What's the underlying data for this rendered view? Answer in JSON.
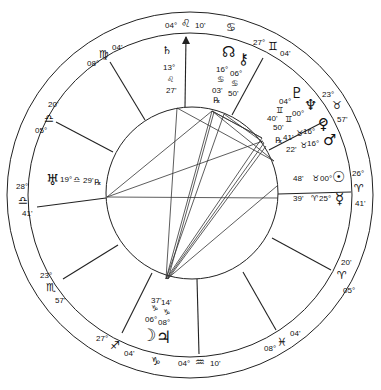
{
  "chart": {
    "type": "natal-astrology-wheel",
    "houses": [
      {
        "cusp": "asc",
        "deg": "28°",
        "sign": "♎",
        "min": "41'"
      },
      {
        "cusp": "2",
        "deg": "23°",
        "sign": "♏",
        "min": "57'"
      },
      {
        "cusp": "3",
        "deg": "27°",
        "sign": "♐",
        "min": "04'"
      },
      {
        "cusp": "ic",
        "deg": "04°",
        "sign": "♒",
        "min": "10'"
      },
      {
        "cusp": "5",
        "deg": "08°",
        "sign": "♓",
        "min": "04'"
      },
      {
        "cusp": "6",
        "deg": "05°",
        "sign": "♈",
        "min": "20'"
      },
      {
        "cusp": "dsc",
        "deg": "26°",
        "sign": "♈",
        "min": "41'"
      },
      {
        "cusp": "8",
        "deg": "23°",
        "sign": "♉",
        "min": "57'"
      },
      {
        "cusp": "9",
        "deg": "27°",
        "sign": "♊",
        "min": "04'"
      },
      {
        "cusp": "mc",
        "deg": "04°",
        "sign": "♌",
        "min": "10'"
      },
      {
        "cusp": "11",
        "deg": "08°",
        "sign": "♍",
        "min": "04'"
      },
      {
        "cusp": "12",
        "deg": "05°",
        "sign": "♎",
        "min": "20'"
      }
    ],
    "intercepted": [
      {
        "sign": "♋",
        "label": "cancer-intercepted"
      },
      {
        "sign": "♑",
        "label": "capricorn-intercepted"
      }
    ],
    "planets": {
      "saturn": {
        "glyph": "♄",
        "deg": "13°",
        "sign": "♌",
        "min": "27'"
      },
      "node": {
        "glyph": "☊",
        "deg": "16°",
        "sign": "♋",
        "min": "03'",
        "retro": "℞"
      },
      "chiron": {
        "glyph": "⚷",
        "deg": "06°",
        "sign": "♋",
        "min": "50'"
      },
      "pluto": {
        "glyph": "♇",
        "deg": "04°",
        "sign": "♊",
        "min": "40'"
      },
      "neptune": {
        "glyph": "♆",
        "deg": "00°",
        "sign": "♊",
        "min": "50'"
      },
      "venus": {
        "glyph": "♀",
        "deg": "16°",
        "sign": "♉",
        "min": "41'",
        "retro": "℞"
      },
      "mars": {
        "glyph": "♂",
        "deg": "16°",
        "sign": "♉",
        "min": "22'"
      },
      "sun": {
        "glyph": "☉",
        "deg": "00°",
        "sign": "♉",
        "min": "48'"
      },
      "mercury": {
        "glyph": "☿",
        "deg": "25°",
        "sign": "♈",
        "min": "39'"
      },
      "uranus": {
        "glyph": "♅",
        "deg": "19°",
        "sign": "♎",
        "min": "29'",
        "retro": "℞"
      },
      "moon": {
        "glyph": "☽",
        "deg": "06°",
        "sign": "♑",
        "min": "37'"
      },
      "jupiter": {
        "glyph": "♃",
        "deg": "08°",
        "sign": "♑",
        "min": "14'"
      }
    }
  }
}
